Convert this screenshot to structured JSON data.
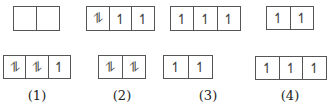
{
  "options": [
    {
      "label": "(1)",
      "top": [
        "",
        ""
      ],
      "bottom": [
        "⥮",
        "⥮",
        "↿"
      ]
    },
    {
      "label": "(2)",
      "top": [
        "⥮",
        "↿",
        "↿"
      ],
      "bottom": [
        "⥮",
        "⥮"
      ]
    },
    {
      "label": "(3)",
      "top": [
        "↿",
        "↿",
        "↿"
      ],
      "bottom": [
        "↿",
        "↿"
      ]
    },
    {
      "label": "(4)",
      "top": [
        "↿",
        "↿"
      ],
      "bottom": [
        "↿",
        "↿",
        "↿"
      ]
    }
  ]
}
